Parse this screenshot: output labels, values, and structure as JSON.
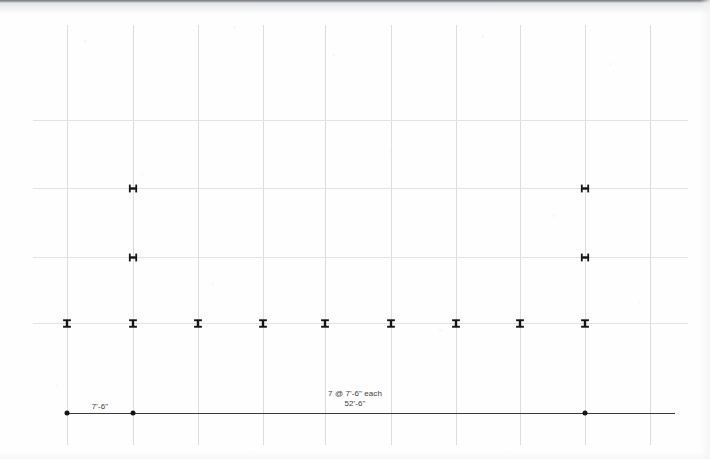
{
  "drawing": {
    "title": "structural framing plan dimension line",
    "sheet_size": {
      "width": 710,
      "height": 459
    },
    "background_color": "#fefefe",
    "grid_color": "#dcdde1",
    "ink_color": "#151517"
  },
  "dimensions": {
    "left_bay_label": "7'-6\"",
    "typical_bay_label": "7 @ 7'-6\" each",
    "overall_label": "52'-6\"",
    "left_bay_value_ft": 7.5,
    "bay_count": 7,
    "bay_spacing_ft": 7.5,
    "overall_length_ft": 52.5
  },
  "grid": {
    "vertical_lines_x": [
      67,
      133,
      198,
      263,
      325,
      391,
      456,
      520,
      585,
      650
    ],
    "vertical_top": 25,
    "vertical_bottom": 445,
    "horizontal_lines": [
      {
        "y": 120,
        "x1": 33,
        "x2": 688
      },
      {
        "y": 188,
        "x1": 33,
        "x2": 688
      },
      {
        "y": 257,
        "x1": 33,
        "x2": 688
      },
      {
        "y": 323,
        "x1": 33,
        "x2": 688
      }
    ]
  },
  "markers": {
    "upright_columns": [
      {
        "name": "column-upper-left",
        "x": 133,
        "y": 188
      },
      {
        "name": "column-upper-right",
        "x": 585,
        "y": 188
      },
      {
        "name": "column-mid-left",
        "x": 133,
        "y": 257
      },
      {
        "name": "column-mid-right",
        "x": 585,
        "y": 257
      }
    ],
    "rotated_beams": [
      {
        "name": "beam-1",
        "x": 67,
        "y": 323
      },
      {
        "name": "beam-2",
        "x": 133,
        "y": 323
      },
      {
        "name": "beam-3",
        "x": 198,
        "y": 323
      },
      {
        "name": "beam-4",
        "x": 263,
        "y": 323
      },
      {
        "name": "beam-5",
        "x": 325,
        "y": 323
      },
      {
        "name": "beam-6",
        "x": 391,
        "y": 323
      },
      {
        "name": "beam-7",
        "x": 456,
        "y": 323
      },
      {
        "name": "beam-8",
        "x": 520,
        "y": 323
      },
      {
        "name": "beam-9",
        "x": 585,
        "y": 323
      }
    ]
  },
  "dimension_line": {
    "y": 413,
    "x_start": 67,
    "x_end": 675,
    "dots_x": [
      67,
      133,
      585
    ],
    "left_label_x": 100,
    "left_label_y": 402,
    "center_label_x": 355,
    "center_label_y": 389
  }
}
